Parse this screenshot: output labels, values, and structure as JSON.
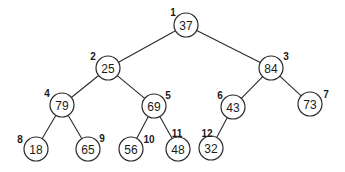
{
  "diagram": {
    "type": "binary-tree",
    "nodes": [
      {
        "index": "1",
        "value": "37",
        "x": 186,
        "y": 25,
        "lx": 173,
        "ly": 12
      },
      {
        "index": "2",
        "value": "25",
        "x": 108,
        "y": 68,
        "lx": 93,
        "ly": 56
      },
      {
        "index": "3",
        "value": "84",
        "x": 271,
        "y": 68,
        "lx": 286,
        "ly": 56
      },
      {
        "index": "4",
        "value": "79",
        "x": 62,
        "y": 105,
        "lx": 47,
        "ly": 93
      },
      {
        "index": "5",
        "value": "69",
        "x": 154,
        "y": 106,
        "lx": 168,
        "ly": 95
      },
      {
        "index": "6",
        "value": "43",
        "x": 233,
        "y": 107,
        "lx": 220,
        "ly": 95
      },
      {
        "index": "7",
        "value": "73",
        "x": 310,
        "y": 104,
        "lx": 326,
        "ly": 94
      },
      {
        "index": "8",
        "value": "18",
        "x": 36,
        "y": 149,
        "lx": 20,
        "ly": 139
      },
      {
        "index": "9",
        "value": "65",
        "x": 88,
        "y": 149,
        "lx": 102,
        "ly": 138
      },
      {
        "index": "10",
        "value": "56",
        "x": 131,
        "y": 149,
        "lx": 149,
        "ly": 139
      },
      {
        "index": "11",
        "value": "48",
        "x": 178,
        "y": 149,
        "lx": 177,
        "ly": 133
      },
      {
        "index": "12",
        "value": "32",
        "x": 211,
        "y": 148,
        "lx": 207,
        "ly": 133
      }
    ],
    "edges": [
      [
        0,
        1
      ],
      [
        0,
        2
      ],
      [
        1,
        3
      ],
      [
        1,
        4
      ],
      [
        2,
        5
      ],
      [
        2,
        6
      ],
      [
        3,
        7
      ],
      [
        3,
        8
      ],
      [
        4,
        9
      ],
      [
        4,
        10
      ],
      [
        5,
        11
      ]
    ],
    "node_radius": 12
  }
}
